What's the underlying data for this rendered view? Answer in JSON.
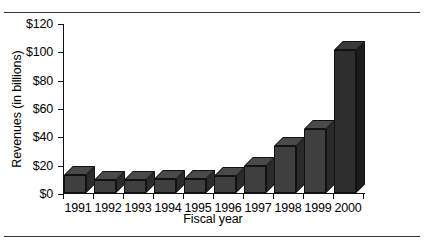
{
  "chart_data": {
    "type": "bar",
    "title": "",
    "xlabel": "Fiscal year",
    "ylabel": "Revenues (in billions)",
    "categories": [
      "1991",
      "1992",
      "1993",
      "1994",
      "1995",
      "1996",
      "1997",
      "1998",
      "1999",
      "2000"
    ],
    "values": [
      13,
      9,
      9,
      10,
      10,
      12,
      19,
      33,
      45,
      101
    ],
    "ylim": [
      0,
      120
    ],
    "ytick_values": [
      0,
      20,
      40,
      60,
      80,
      100,
      120
    ],
    "ytick_labels": [
      "$0",
      "$20",
      "$40",
      "$60",
      "$80",
      "$100",
      "$120"
    ],
    "grid": false,
    "legend": null,
    "style": "3d-bar",
    "colors": {
      "bar_front": "#3f3f3f",
      "bar_top": "#4a4a4a",
      "bar_side": "#2b2b2b",
      "axis": "#111111",
      "background": "#ffffff",
      "rule": "#3a3a3a"
    }
  },
  "figure": {
    "top_rule": "",
    "bottom_rule": ""
  }
}
